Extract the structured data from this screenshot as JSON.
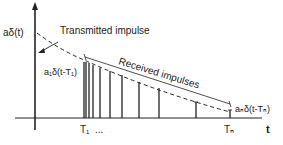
{
  "diagram": {
    "y_axis_label": "aδ(t)",
    "x_axis_label": "t",
    "transmitted_label": "Transmitted impulse",
    "received_label": "Received impulses",
    "first_impulse_label": "a₁δ(t-T₁)",
    "last_impulse_label": "aₙδ(t-Tₙ)",
    "tick_T1": "T₁",
    "tick_ellipsis": "...",
    "tick_Tn": "Tₙ",
    "colors": {
      "line": "#222222",
      "background": "#ffffff"
    },
    "impulses_x": [
      84,
      86,
      88,
      91,
      95,
      100,
      108,
      115,
      125,
      138,
      158,
      196,
      230
    ],
    "impulse_heights": [
      60,
      58,
      57,
      55,
      53,
      50,
      47,
      44,
      40,
      36,
      30,
      14,
      6
    ]
  }
}
